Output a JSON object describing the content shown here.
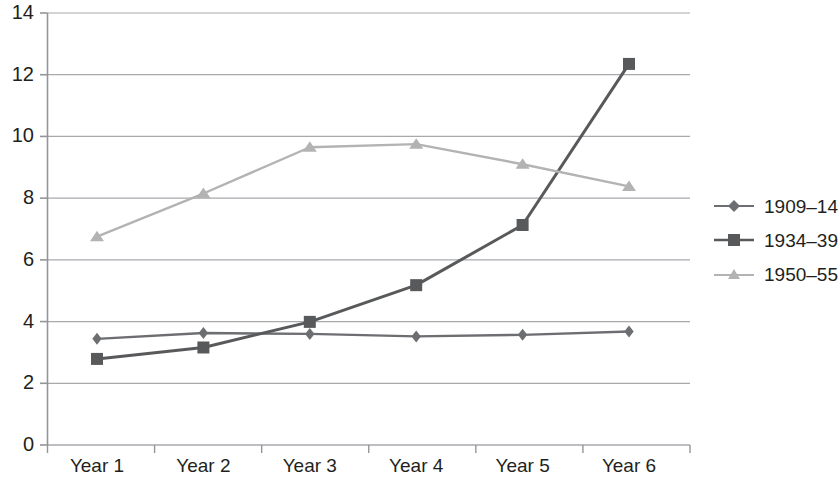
{
  "chart_data": {
    "type": "line",
    "title": "",
    "subtitle": "",
    "xlabel": "",
    "ylabel": "",
    "categories": [
      "Year 1",
      "Year 2",
      "Year 3",
      "Year 4",
      "Year 5",
      "Year 6"
    ],
    "ylim": [
      0,
      14
    ],
    "yticks": [
      0,
      2,
      4,
      6,
      8,
      10,
      12,
      14
    ],
    "ytick_labels": [
      "0",
      "2",
      "4",
      "6",
      "8",
      "10",
      "12",
      "14"
    ],
    "grid": "horizontal",
    "legend_position": "right",
    "series": [
      {
        "name": "1909–14",
        "marker": "diamond",
        "color": "#6d6e71",
        "values": [
          3.44,
          3.63,
          3.6,
          3.52,
          3.57,
          3.68
        ]
      },
      {
        "name": "1934–39",
        "marker": "square",
        "color": "#58595b",
        "values": [
          2.79,
          3.16,
          3.99,
          5.18,
          7.13,
          12.35
        ]
      },
      {
        "name": "1950–55",
        "marker": "triangle",
        "color": "#b3b3b3",
        "values": [
          6.75,
          8.15,
          9.65,
          9.75,
          9.1,
          8.38
        ]
      }
    ]
  },
  "axis": {
    "y_labels": [
      "14",
      "12",
      "10",
      "8",
      "6",
      "4",
      "2",
      "0"
    ],
    "x_labels": [
      "Year 1",
      "Year 2",
      "Year 3",
      "Year 4",
      "Year 5",
      "Year 6"
    ]
  },
  "legend": {
    "items": [
      {
        "label": "1909–14"
      },
      {
        "label": "1934–39"
      },
      {
        "label": "1950–55"
      }
    ]
  },
  "colors": {
    "series_1909": "#6d6e71",
    "series_1934": "#58595b",
    "series_1950": "#b3b3b3",
    "gridline": "#a7a9ac",
    "axis": "#939598",
    "text": "#231f20",
    "background": "#ffffff"
  }
}
